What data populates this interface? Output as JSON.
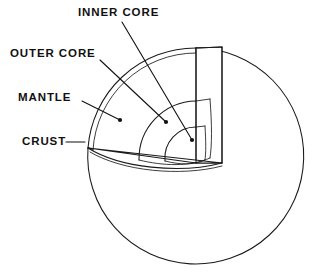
{
  "diagram": {
    "background_color": "#ffffff",
    "line_color": "#1a1a1a",
    "text_color": "#111111",
    "labels": [
      {
        "id": "inner-core",
        "text": "INNER CORE",
        "text_x": 78,
        "text_y": 13,
        "leader_from_x": 122,
        "leader_from_y": 22,
        "leader_to_x": 192,
        "leader_to_y": 140
      },
      {
        "id": "outer-core",
        "text": "OUTER CORE",
        "text_x": 10,
        "text_y": 54,
        "leader_from_x": 100,
        "leader_from_y": 60,
        "leader_to_x": 166,
        "leader_to_y": 122
      },
      {
        "id": "mantle",
        "text": "MANTLE",
        "text_x": 18,
        "text_y": 98,
        "leader_from_x": 82,
        "leader_from_y": 101,
        "leader_to_x": 120,
        "leader_to_y": 120
      },
      {
        "id": "crust",
        "text": "CRUST",
        "text_x": 22,
        "text_y": 142,
        "leader_from_x": 66,
        "leader_from_y": 142,
        "leader_to_x": 85,
        "leader_to_y": 142
      }
    ],
    "sphere": {
      "center_x": 196,
      "center_y": 156,
      "radius": 108
    },
    "layers": [
      {
        "name": "crust",
        "order": 1,
        "relative_radius": 1.0
      },
      {
        "name": "mantle",
        "order": 2,
        "relative_radius": 0.97
      },
      {
        "name": "outer core",
        "order": 3,
        "relative_radius": 0.55
      },
      {
        "name": "inner core",
        "order": 4,
        "relative_radius": 0.27
      }
    ]
  }
}
